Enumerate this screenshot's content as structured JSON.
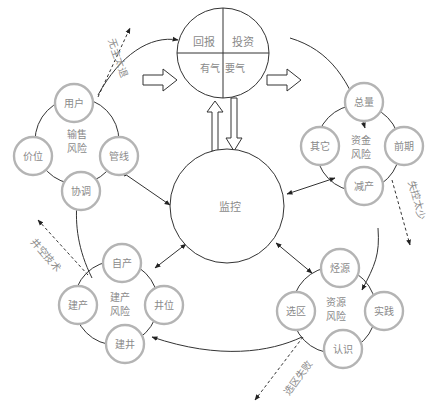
{
  "diagram": {
    "top": {
      "quadrants": [
        "回报",
        "投资",
        "有气",
        "要气"
      ]
    },
    "center": {
      "label": "监控"
    },
    "clusters": [
      {
        "id": "sales",
        "label_lines": [
          "输售",
          "风险"
        ],
        "nodes": [
          "用户",
          "价位",
          "管线",
          "协调"
        ]
      },
      {
        "id": "funding",
        "label_lines": [
          "资金",
          "风险"
        ],
        "nodes": [
          "总量",
          "其它",
          "前期",
          "减产"
        ]
      },
      {
        "id": "construction",
        "label_lines": [
          "建产",
          "风险"
        ],
        "nodes": [
          "自产",
          "建产",
          "井位",
          "建井"
        ]
      },
      {
        "id": "resource",
        "label_lines": [
          "资源",
          "风险"
        ],
        "nodes": [
          "烃源",
          "选区",
          "实践",
          "认识"
        ]
      }
    ],
    "dashed_labels": {
      "top_left": "无主太退",
      "right": "失控太少",
      "left": "井空技术",
      "bottom": "选区失败"
    }
  }
}
